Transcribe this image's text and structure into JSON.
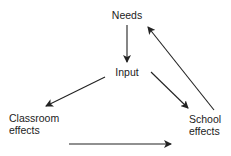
{
  "diagram": {
    "nodes": {
      "needs": {
        "lines": [
          "Needs"
        ]
      },
      "input": {
        "lines": [
          "Input"
        ]
      },
      "classroom": {
        "lines": [
          "Classroom",
          "effects"
        ]
      },
      "school": {
        "lines": [
          "School",
          "effects"
        ]
      }
    },
    "edges": [
      {
        "from": "Needs",
        "to": "Input"
      },
      {
        "from": "Input",
        "to": "Classroom effects"
      },
      {
        "from": "Input",
        "to": "School effects"
      },
      {
        "from": "School effects",
        "to": "Needs"
      },
      {
        "from": "Classroom effects",
        "to": "School effects"
      }
    ],
    "colors": {
      "line": "#222222",
      "text": "#222222",
      "background": "#ffffff"
    }
  }
}
